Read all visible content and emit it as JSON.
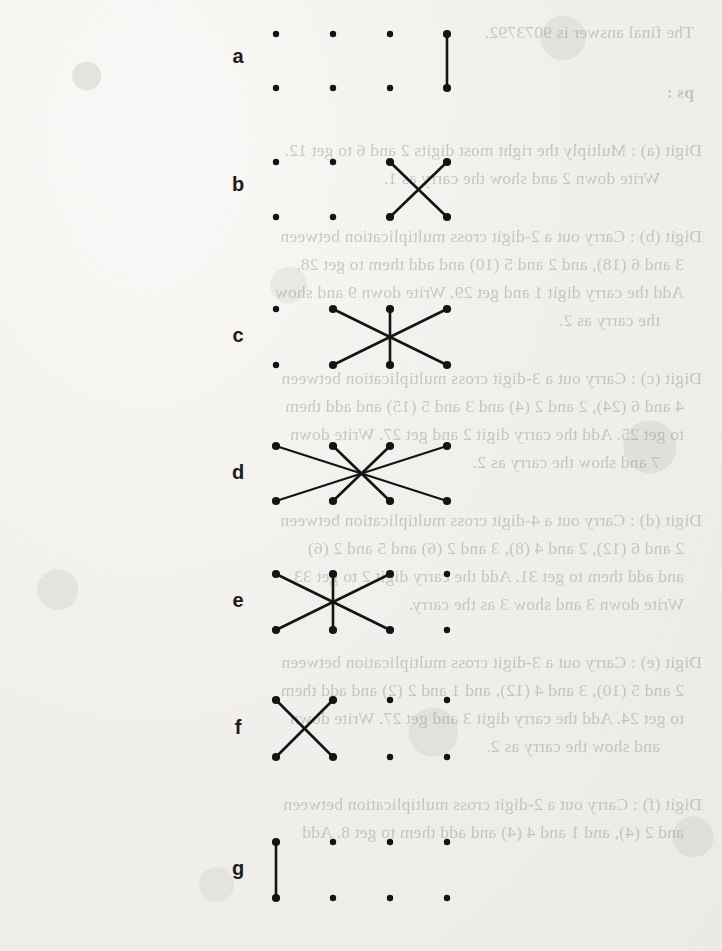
{
  "document": {
    "kind": "scanned-worksheet-page",
    "title": "Cross multiplication dot-and-line step diagrams",
    "ink_color": "#141414",
    "paper_color": "#f1f0ec",
    "bleed_text_color": "#8d8b84"
  },
  "grid": {
    "columns_x": [
      276,
      333,
      390,
      447
    ],
    "dot_radius": 3.2,
    "rows": [
      {
        "label": "a",
        "label_x": 226,
        "label_y": 58,
        "top_y": 34,
        "bottom_y": 88,
        "pattern": "vertical",
        "segments": [
          {
            "x1": 447,
            "y1": 34,
            "x2": 447,
            "y2": 88
          }
        ]
      },
      {
        "label": "b",
        "label_x": 226,
        "label_y": 186,
        "top_y": 162,
        "bottom_y": 217,
        "pattern": "cross-2",
        "segments": [
          {
            "x1": 390,
            "y1": 162,
            "x2": 447,
            "y2": 217
          },
          {
            "x1": 447,
            "y1": 162,
            "x2": 390,
            "y2": 217
          }
        ]
      },
      {
        "label": "c",
        "label_x": 226,
        "label_y": 337,
        "top_y": 309,
        "bottom_y": 365,
        "pattern": "star-3",
        "segments": [
          {
            "x1": 333,
            "y1": 309,
            "x2": 447,
            "y2": 365
          },
          {
            "x1": 447,
            "y1": 309,
            "x2": 333,
            "y2": 365
          },
          {
            "x1": 390,
            "y1": 309,
            "x2": 390,
            "y2": 365
          }
        ]
      },
      {
        "label": "d",
        "label_x": 226,
        "label_y": 474,
        "top_y": 446,
        "bottom_y": 501,
        "pattern": "star-4",
        "segments": [
          {
            "x1": 276,
            "y1": 446,
            "x2": 447,
            "y2": 501
          },
          {
            "x1": 447,
            "y1": 446,
            "x2": 276,
            "y2": 501
          },
          {
            "x1": 333,
            "y1": 446,
            "x2": 390,
            "y2": 501
          },
          {
            "x1": 390,
            "y1": 446,
            "x2": 333,
            "y2": 501
          }
        ]
      },
      {
        "label": "e",
        "label_x": 226,
        "label_y": 602,
        "top_y": 574,
        "bottom_y": 630,
        "pattern": "star-3",
        "segments": [
          {
            "x1": 276,
            "y1": 574,
            "x2": 390,
            "y2": 630
          },
          {
            "x1": 390,
            "y1": 574,
            "x2": 276,
            "y2": 630
          },
          {
            "x1": 333,
            "y1": 574,
            "x2": 333,
            "y2": 630
          }
        ]
      },
      {
        "label": "f",
        "label_x": 226,
        "label_y": 729,
        "top_y": 700,
        "bottom_y": 757,
        "pattern": "cross-2",
        "segments": [
          {
            "x1": 276,
            "y1": 700,
            "x2": 333,
            "y2": 757
          },
          {
            "x1": 333,
            "y1": 700,
            "x2": 276,
            "y2": 757
          }
        ]
      },
      {
        "label": "g",
        "label_x": 226,
        "label_y": 870,
        "top_y": 842,
        "bottom_y": 898,
        "pattern": "vertical",
        "segments": [
          {
            "x1": 276,
            "y1": 842,
            "x2": 276,
            "y2": 898
          }
        ]
      }
    ]
  },
  "bleed_through_text": [
    {
      "x": 28,
      "y": 22,
      "text": "The final answer is 9073792.",
      "bold": false
    },
    {
      "x": 28,
      "y": 82,
      "text": "ps :",
      "bold": true
    },
    {
      "x": 20,
      "y": 140,
      "text": "Digit (a) : Multiply the right most digits 2 and 6 to get 12.",
      "bold": false
    },
    {
      "x": 62,
      "y": 168,
      "text": "Write down 2 and show the carry as 1.",
      "bold": false
    },
    {
      "x": 20,
      "y": 226,
      "text": "Digit (b) : Carry out a 2-digit cross multiplication between",
      "bold": false
    },
    {
      "x": 38,
      "y": 254,
      "text": "3 and 6 (18), and 2 and 5 (10) and add them to get 28.",
      "bold": false
    },
    {
      "x": 38,
      "y": 282,
      "text": "Add the carry digit 1 and get 29. Write down 9 and show",
      "bold": false
    },
    {
      "x": 62,
      "y": 310,
      "text": "the carry as 2.",
      "bold": false
    },
    {
      "x": 20,
      "y": 368,
      "text": "Digit (c) : Carry out a 3-digit cross multiplication between",
      "bold": false
    },
    {
      "x": 38,
      "y": 396,
      "text": "4 and 6 (24), 2 and 2 (4) and 3 and 5 (15) and add them",
      "bold": false
    },
    {
      "x": 38,
      "y": 424,
      "text": "to get 25. Add the carry digit 2 and get 27. Write down",
      "bold": false
    },
    {
      "x": 62,
      "y": 452,
      "text": "7 and show the carry as 2.",
      "bold": false
    },
    {
      "x": 20,
      "y": 510,
      "text": "Digit (d) : Carry out a 4-digit cross multiplication between",
      "bold": false
    },
    {
      "x": 38,
      "y": 538,
      "text": "2 and 6 (12), 2 and 4 (8), 3 and 2 (6) and 5 and 2 (6)",
      "bold": false
    },
    {
      "x": 38,
      "y": 566,
      "text": "and add them to get 31. Add the carry digit 2 to get 33.",
      "bold": false
    },
    {
      "x": 38,
      "y": 594,
      "text": "Write down 3 and show 3 as the carry.",
      "bold": false
    },
    {
      "x": 20,
      "y": 652,
      "text": "Digit (e) : Carry out a 3-digit cross multiplication between",
      "bold": false
    },
    {
      "x": 38,
      "y": 680,
      "text": "2 and 5 (10), 3 and 4 (12), and 1 and 2 (2) and add them",
      "bold": false
    },
    {
      "x": 38,
      "y": 708,
      "text": "to get 24. Add the carry digit 3 and get 27. Write down",
      "bold": false
    },
    {
      "x": 62,
      "y": 736,
      "text": "and show the carry as 2.",
      "bold": false
    },
    {
      "x": 20,
      "y": 794,
      "text": "Digit (f) : Carry out a 2-digit cross multiplication between",
      "bold": false
    },
    {
      "x": 38,
      "y": 822,
      "text": "and 2 (4), and 1 and 4 (4) and add them to get 8. Add",
      "bold": false
    }
  ]
}
